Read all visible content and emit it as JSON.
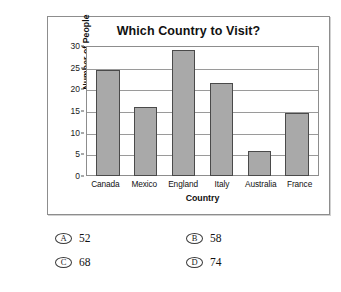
{
  "page": {
    "top_cropped_text": "· · ·· ·"
  },
  "chart_data": {
    "type": "bar",
    "title": "Which Country to Visit?",
    "xlabel": "Country",
    "ylabel": "Number of People",
    "categories": [
      "Canada",
      "Mexico",
      "England",
      "Italy",
      "Australia",
      "France"
    ],
    "values": [
      24.5,
      16,
      29,
      21.5,
      5.7,
      14.6
    ],
    "ylim": [
      0,
      30
    ],
    "yticks": [
      0,
      5,
      10,
      15,
      20,
      25,
      30
    ],
    "ytick_labels": [
      "0",
      "5",
      "10",
      "15",
      "20",
      "25",
      "30"
    ],
    "grid": true,
    "legend": null,
    "bar_color": "#a9a9a9",
    "bar_border_color": "#4a4a4a"
  },
  "options": [
    {
      "letter": "A",
      "text": "52"
    },
    {
      "letter": "B",
      "text": "58"
    },
    {
      "letter": "C",
      "text": "68"
    },
    {
      "letter": "D",
      "text": "74"
    }
  ]
}
